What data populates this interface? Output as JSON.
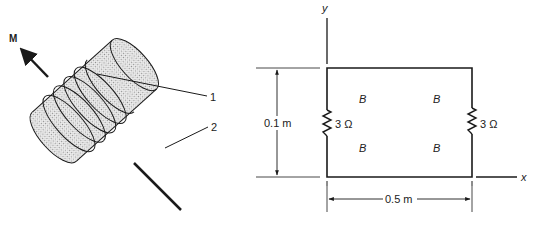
{
  "figure_left": {
    "title": "Coil wound on cylinder with magnetic moment",
    "moment_label": "M",
    "callouts": [
      {
        "id": "1",
        "label": "1",
        "target": "coil winding"
      },
      {
        "id": "2",
        "label": "2",
        "target": "cylinder core"
      }
    ]
  },
  "figure_right": {
    "title": "Rectangular loop with resistors in magnetic field",
    "axes": {
      "x_label": "x",
      "y_label": "y"
    },
    "height_dimension": "0.1 m",
    "width_dimension": "0.5 m",
    "resistors": [
      {
        "side": "left",
        "label": "3 Ω"
      },
      {
        "side": "right",
        "label": "3 Ω"
      }
    ],
    "field_labels": [
      "B",
      "B",
      "B",
      "B"
    ]
  },
  "colors": {
    "stroke": "#1a1a1a",
    "fill_stipple": "#d9d9d9",
    "background": "#ffffff"
  }
}
